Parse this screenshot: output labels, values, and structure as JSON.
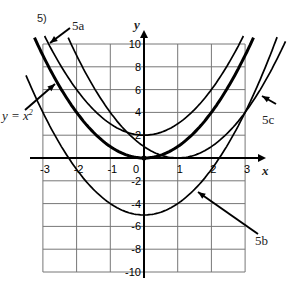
{
  "problem_number": "5)",
  "labels": {
    "a": "5a",
    "b": "5b",
    "c": "5c",
    "parent": "y = x",
    "parent_exp": "2",
    "x_axis": "x",
    "y_axis": "y"
  },
  "chart_data": {
    "type": "line",
    "title": "",
    "xlabel": "x",
    "ylabel": "y",
    "xlim": [
      -3,
      3
    ],
    "ylim": [
      -10,
      10
    ],
    "grid": true,
    "x_ticks": [
      -3,
      -2,
      -1,
      0,
      1,
      2,
      3
    ],
    "y_ticks": [
      -10,
      -8,
      -6,
      -4,
      -2,
      2,
      4,
      6,
      8,
      10
    ],
    "series": [
      {
        "name": "y = x^2",
        "h": 0,
        "k": 0,
        "thick": true
      },
      {
        "name": "5a",
        "h": 0,
        "k": 2,
        "thick": false
      },
      {
        "name": "5b",
        "h": 0,
        "k": -5,
        "thick": false
      },
      {
        "name": "5c",
        "h": 1,
        "k": 0,
        "thick": false
      }
    ]
  }
}
